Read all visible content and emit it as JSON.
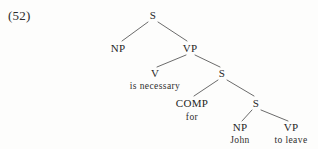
{
  "figure": {
    "example_number": "(52)",
    "background_color": "#fdfdfc",
    "ink_color": "#262626",
    "line_color": "#5a5a5a"
  },
  "tree": {
    "nodes": [
      {
        "id": "s-root",
        "label": "S",
        "x": 153,
        "y": 15
      },
      {
        "id": "np-subj",
        "label": "NP",
        "x": 118,
        "y": 48
      },
      {
        "id": "vp-main",
        "label": "VP",
        "x": 190,
        "y": 48
      },
      {
        "id": "v-main",
        "label": "V",
        "x": 155,
        "y": 73
      },
      {
        "id": "s-embed1",
        "label": "S",
        "x": 222,
        "y": 73
      },
      {
        "id": "comp",
        "label": "COMP",
        "x": 192,
        "y": 103
      },
      {
        "id": "s-embed2",
        "label": "S",
        "x": 256,
        "y": 103
      },
      {
        "id": "np-john",
        "label": "NP",
        "x": 240,
        "y": 127
      },
      {
        "id": "vp-leave",
        "label": "VP",
        "x": 291,
        "y": 127
      }
    ],
    "terminals": [
      {
        "id": "v-main-word",
        "parent": "v-main",
        "label": "is  necessary",
        "x": 155,
        "y": 86
      },
      {
        "id": "comp-word",
        "parent": "comp",
        "label": "for",
        "x": 192,
        "y": 117
      },
      {
        "id": "np-john-word",
        "parent": "np-john",
        "label": "John",
        "x": 240,
        "y": 140
      },
      {
        "id": "vp-leave-word",
        "parent": "vp-leave",
        "label": "to  leave",
        "x": 291,
        "y": 140
      }
    ],
    "edges": [
      {
        "id": "edge-s-np",
        "from": "s-root",
        "to": "np-subj",
        "x1": 148,
        "y1": 22,
        "x2": 122,
        "y2": 41
      },
      {
        "id": "edge-s-vp",
        "from": "s-root",
        "to": "vp-main",
        "x1": 158,
        "y1": 22,
        "x2": 187,
        "y2": 41
      },
      {
        "id": "edge-vp-v",
        "from": "vp-main",
        "to": "v-main",
        "x1": 186,
        "y1": 55,
        "x2": 157,
        "y2": 67
      },
      {
        "id": "edge-vp-s",
        "from": "vp-main",
        "to": "s-embed1",
        "x1": 195,
        "y1": 55,
        "x2": 220,
        "y2": 67
      },
      {
        "id": "edge-s1-comp",
        "from": "s-embed1",
        "to": "comp",
        "x1": 218,
        "y1": 80,
        "x2": 194,
        "y2": 96
      },
      {
        "id": "edge-s1-s2",
        "from": "s-embed1",
        "to": "s-embed2",
        "x1": 227,
        "y1": 80,
        "x2": 254,
        "y2": 96
      },
      {
        "id": "edge-s2-np",
        "from": "s-embed2",
        "to": "np-john",
        "x1": 252,
        "y1": 110,
        "x2": 242,
        "y2": 121
      },
      {
        "id": "edge-s2-vp",
        "from": "s-embed2",
        "to": "vp-leave",
        "x1": 261,
        "y1": 110,
        "x2": 288,
        "y2": 121
      }
    ]
  }
}
